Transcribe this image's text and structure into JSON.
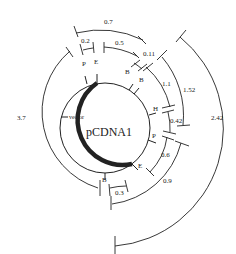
{
  "diagram": {
    "plasmid_name": "pCDNA1",
    "vector_label": "vector",
    "sites": [
      {
        "label": "P",
        "angle": -15
      },
      {
        "label": "E",
        "angle": -2
      },
      {
        "label": "B",
        "angle": 38
      },
      {
        "label": "B",
        "angle": 46
      },
      {
        "label": "H",
        "angle": 78
      },
      {
        "label": "P",
        "angle": 107
      },
      {
        "label": "E",
        "angle": 130
      },
      {
        "label": "B",
        "angle": 180
      }
    ],
    "fragments": [
      {
        "label": "0.7"
      },
      {
        "label": "0.2"
      },
      {
        "label": "0.5"
      },
      {
        "label": "0.11"
      },
      {
        "label": "1.1"
      },
      {
        "label": "1.52"
      },
      {
        "label": "0.42"
      },
      {
        "label": "2.42"
      },
      {
        "label": "3.7"
      },
      {
        "label": "0.6"
      },
      {
        "label": "0.9"
      },
      {
        "label": "0.3"
      }
    ]
  }
}
